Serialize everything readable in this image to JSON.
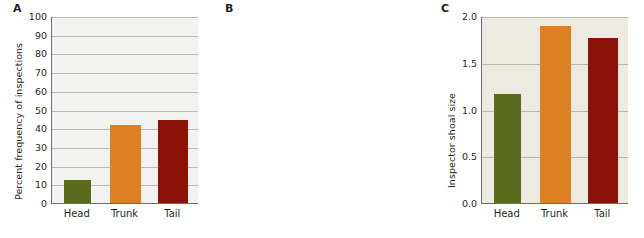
{
  "figure": {
    "background": "#ffffff",
    "colors": {
      "head": "#5a6b1e",
      "trunk": "#dd8023",
      "tail": "#8b1208",
      "axis": "#6d6e71",
      "grid": "#b9b7b2",
      "text": "#231f20"
    }
  },
  "panels": [
    {
      "letter": "A",
      "plot_background": "#f2f2f1",
      "chart_data": {
        "type": "bar",
        "title": "",
        "xlabel": "",
        "ylabel": "Percent frequency of inspections",
        "categories": [
          "Head",
          "Trunk",
          "Tail"
        ],
        "values": [
          12.5,
          41.8,
          44.5
        ],
        "colors": [
          "#5a6b1e",
          "#dd8023",
          "#8b1208"
        ],
        "ylim": [
          0,
          100
        ],
        "yticks": [
          0,
          10,
          20,
          30,
          40,
          50,
          60,
          70,
          80,
          90,
          100
        ],
        "ytick_labels": [
          "0",
          "10",
          "20",
          "30",
          "40",
          "50",
          "60",
          "70",
          "80",
          "90",
          "100"
        ],
        "grid": true,
        "legend": "none"
      }
    },
    {
      "letter": "B",
      "plot_background": "#eceae1",
      "chart_data": {
        "type": "bar",
        "title": "",
        "xlabel": "",
        "ylabel": "Inspector shoal size",
        "categories": [
          "Head",
          "Trunk",
          "Tail"
        ],
        "values": [
          1.17,
          1.89,
          1.77
        ],
        "colors": [
          "#5a6b1e",
          "#dd8023",
          "#8b1208"
        ],
        "ylim": [
          0,
          2.0
        ],
        "yticks": [
          0,
          0.5,
          1.0,
          1.5,
          2.0
        ],
        "ytick_labels": [
          "0.0",
          "0.5",
          "1.0",
          "1.5",
          "2.0"
        ],
        "grid": true,
        "legend": "none"
      }
    },
    {
      "letter": "C",
      "plot_background": "#e9e3d7",
      "chart_data": {
        "type": "bar",
        "title": "",
        "xlabel": "",
        "ylabel": "Minimal approach distance (cm)",
        "categories": [
          "Head",
          "Trunk",
          "Tail"
        ],
        "values": [
          6.15,
          3.65,
          2.55
        ],
        "colors": [
          "#5a6b1e",
          "#dd8023",
          "#8b1208"
        ],
        "ylim": [
          0,
          8
        ],
        "yticks": [
          0,
          2,
          4,
          6,
          8
        ],
        "ytick_labels": [
          "0",
          "2",
          "4",
          "6",
          "8"
        ],
        "grid": true,
        "legend": "none"
      }
    }
  ]
}
